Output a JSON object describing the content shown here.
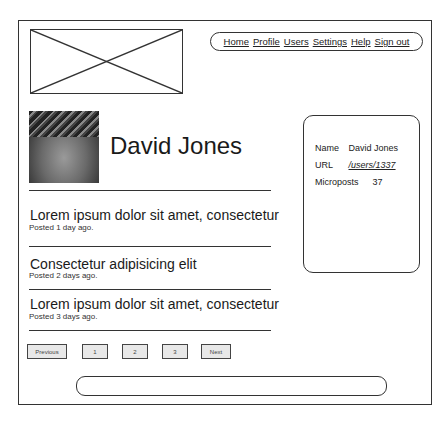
{
  "nav": {
    "items": [
      {
        "label": "Home"
      },
      {
        "label": "Profile"
      },
      {
        "label": "Users"
      },
      {
        "label": "Settings"
      },
      {
        "label": "Help"
      },
      {
        "label": "Sign out"
      }
    ]
  },
  "profile": {
    "name": "David Jones"
  },
  "posts": [
    {
      "title": "Lorem ipsum dolor sit amet, consectetur",
      "meta": "Posted 1 day ago."
    },
    {
      "title": "Consectetur adipisicing elit",
      "meta": "Posted 2 days ago."
    },
    {
      "title": "Lorem ipsum dolor sit amet, consectetur",
      "meta": "Posted 3 days ago."
    }
  ],
  "sidebar": {
    "name_label": "Name",
    "name_value": "David Jones",
    "url_label": "URL",
    "url_value": "/users/1337",
    "microposts_label": "Microposts",
    "microposts_value": "37"
  },
  "pagination": {
    "previous": "Previous",
    "pages": [
      "1",
      "2",
      "3"
    ],
    "next": "Next"
  }
}
